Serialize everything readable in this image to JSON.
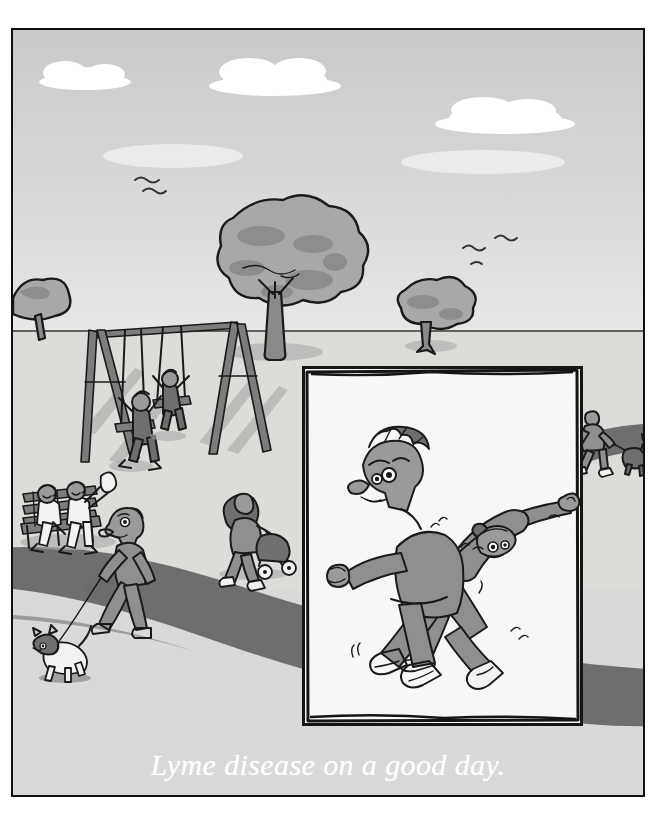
{
  "cartoon": {
    "caption": "Lyme disease on a good day.",
    "signature": "Skidmore",
    "title": "Lyme disease on a good day.",
    "medium": "single-panel gag cartoon, grayscale ink and wash"
  },
  "palette": {
    "sky_top": "#c9c9c9",
    "sky_bottom": "#ebebeb",
    "cloud": "#ffffff",
    "ground": "#dedece",
    "foreground": "#d9d9d9",
    "path_dark": "#6e6e6e",
    "ink": "#1a1a1a",
    "cloth_gray": "#8f8f8f",
    "panel_fill": "#f7f7f7",
    "caption_text": "#ffffff",
    "frame_border": "#111111"
  },
  "scene": {
    "setting": "a public park on a sunny day",
    "sky": {
      "clouds": [
        {
          "name": "cloud-left",
          "x": 45,
          "y": 62,
          "w": 96,
          "h": 22
        },
        {
          "name": "cloud-center",
          "x": 205,
          "y": 58,
          "w": 148,
          "h": 28
        },
        {
          "name": "cloud-right",
          "x": 418,
          "y": 88,
          "w": 152,
          "h": 26
        }
      ],
      "birds": [
        {
          "name": "bird-left-1",
          "x": 136,
          "y": 176
        },
        {
          "name": "bird-left-2",
          "x": 152,
          "y": 186
        },
        {
          "name": "bird-right-1",
          "x": 466,
          "y": 248
        },
        {
          "name": "bird-right-2",
          "x": 497,
          "y": 238
        },
        {
          "name": "bird-right-3",
          "x": 473,
          "y": 260
        }
      ]
    },
    "trees": [
      {
        "name": "tree-large-center",
        "label": "large round-canopy tree"
      },
      {
        "name": "tree-small-right",
        "label": "small round-canopy tree"
      },
      {
        "name": "tree-edge-left",
        "label": "partial tree at left edge"
      }
    ],
    "playground": {
      "name": "swing-set",
      "label": "A-frame swing set with two hanging swings",
      "swings": 2,
      "children_swinging": 2
    },
    "background_figures": [
      {
        "name": "bench-sitter-left",
        "label": "elderly person seated on park bench"
      },
      {
        "name": "bench-sitter-right",
        "label": "elderly person seated on park bench, arms raised"
      },
      {
        "name": "park-bench",
        "label": "slatted wooden park bench"
      },
      {
        "name": "dog-walker-left",
        "label": "man walking a small white terrier on a leash"
      },
      {
        "name": "terrier-dog",
        "label": "small white dog with dark head patch"
      },
      {
        "name": "stroller-mother",
        "label": "woman with long dark hair pushing a baby stroller"
      },
      {
        "name": "stroller",
        "label": "baby stroller with two wheels"
      },
      {
        "name": "dog-walker-right",
        "label": "distant figure walking a dog along the path"
      }
    ],
    "path": {
      "name": "park-path",
      "label": "dark curving paved walkway sweeping from lower-left to right"
    }
  },
  "panel": {
    "name": "inset-panel",
    "label": "hand-drawn framed inset panel containing the two main figures",
    "figures": [
      {
        "name": "figure-upright-man",
        "label": "grimacing man with spiky hair, arms thrust forward, braced on bent legs",
        "expression": "pained grimace, furrowed brow, gritted teeth",
        "clothing": "long-sleeved gray shirt, gray trousers, dark shoes"
      },
      {
        "name": "figure-bent-back-man",
        "label": "second man bent over backwards, head upside down, arm flung out",
        "expression": "strained, eyes wide, head inverted",
        "clothing": "gray shirt and trousers, white sneakers"
      }
    ],
    "motion_marks": {
      "name": "motion-lines",
      "count": 6,
      "label": "short wobble lines showing trembling effort"
    },
    "joke": "The two men are doing the limbo — the 'good day' version of Lyme disease symptoms."
  }
}
